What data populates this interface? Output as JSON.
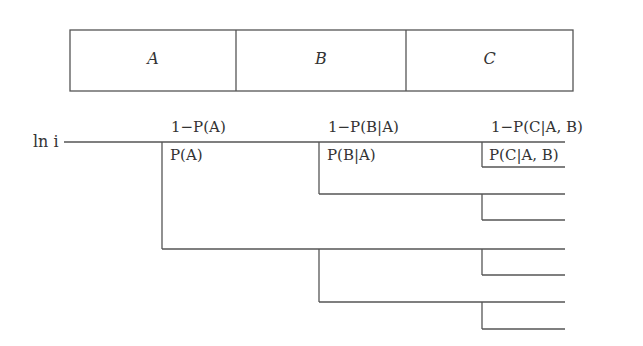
{
  "stages": [
    {
      "label": "A",
      "x0": 70,
      "x1": 236
    },
    {
      "label": "B",
      "x0": 236,
      "x1": 406
    },
    {
      "label": "C",
      "x0": 406,
      "x1": 573
    }
  ],
  "box": {
    "x0": 70,
    "x1": 573,
    "y0": 30,
    "y1": 91
  },
  "root_label": "ln i",
  "branch_labels": {
    "fail_A": "1−P(A)",
    "success_A": "P(A)",
    "fail_B": "1−P(B|A)",
    "success_B": "P(B|A)",
    "fail_C": "1−P(C|A, B)",
    "success_C": "P(C|A, B)"
  },
  "tree": {
    "root_line": {
      "x0": 64,
      "x1": 565,
      "y": 142
    },
    "level1_x": 162,
    "level2_x": 319,
    "level3_x": 482,
    "leaf_end_x": 565,
    "leaf_ys": [
      142,
      167,
      194,
      220,
      249,
      275,
      302,
      329
    ]
  },
  "line_color": "#555555"
}
